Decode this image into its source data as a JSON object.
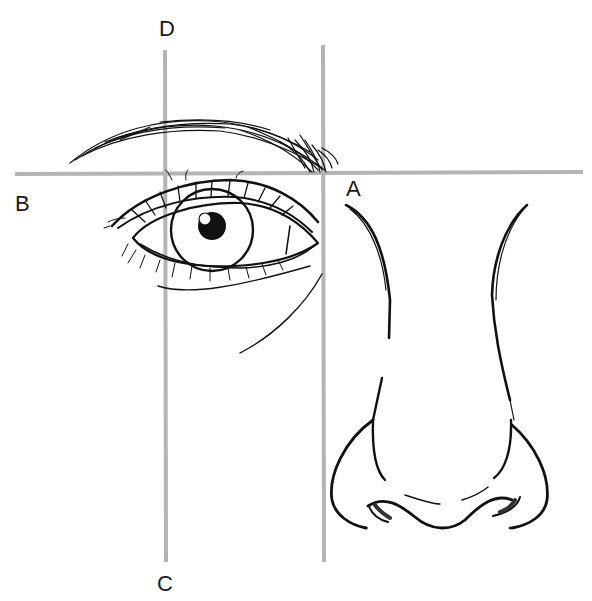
{
  "diagram": {
    "labels": {
      "A": "A",
      "B": "B",
      "C": "C",
      "D": "D"
    },
    "guides": [
      {
        "id": "horizontal-brow-line",
        "from": [
          15,
          173
        ],
        "to": [
          583,
          172
        ]
      },
      {
        "id": "vertical-inner-eye-line",
        "from": [
          165,
          50
        ],
        "to": [
          165,
          562
        ]
      },
      {
        "id": "vertical-nose-wing-line",
        "from": [
          323,
          45
        ],
        "to": [
          323,
          562
        ]
      }
    ],
    "colors": {
      "guide": "#b4b4b4",
      "ink": "#111111",
      "background": "#ffffff"
    }
  }
}
